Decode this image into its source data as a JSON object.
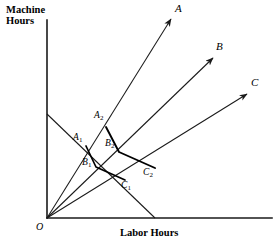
{
  "figure": {
    "kind": "economics-isoquant-process-ray-diagram",
    "background_color": "#ffffff",
    "line_color": "#1a1a1a",
    "width": 278,
    "height": 245
  },
  "axes": {
    "y_axis_title": "Machine\nHours",
    "y_axis_title_line1": "Machine",
    "y_axis_title_line2": "Hours",
    "x_axis_title": "Labor Hours",
    "origin_label": "O",
    "origin_px": [
      47,
      218
    ],
    "x_axis_end_px": [
      272,
      218
    ],
    "y_axis_end_px": [
      47,
      20
    ]
  },
  "process_rays": [
    {
      "name": "A",
      "label": "A",
      "from_px": [
        47,
        218
      ],
      "to_px": [
        171,
        19
      ],
      "arrow": true
    },
    {
      "name": "B",
      "label": "B",
      "from_px": [
        47,
        218
      ],
      "to_px": [
        213,
        58
      ],
      "arrow": true
    },
    {
      "name": "C",
      "label": "C",
      "from_px": [
        47,
        218
      ],
      "to_px": [
        247,
        94
      ],
      "arrow": true
    }
  ],
  "ray_labels": [
    {
      "text": "A",
      "x": 175,
      "y": 3
    },
    {
      "text": "B",
      "x": 216,
      "y": 41
    },
    {
      "text": "C",
      "x": 251,
      "y": 77
    }
  ],
  "isoquants": [
    {
      "name": "inner-isoquant",
      "level": 1,
      "vertices": [
        {
          "label": "A",
          "sub": "1",
          "x": 86,
          "y": 146
        },
        {
          "label": "B",
          "sub": "1",
          "x": 96,
          "y": 167
        },
        {
          "label": "C",
          "sub": "1",
          "x": 125,
          "y": 180
        }
      ]
    },
    {
      "name": "outer-isoquant",
      "level": 2,
      "vertices": [
        {
          "label": "A",
          "sub": "2",
          "x": 106,
          "y": 127
        },
        {
          "label": "B",
          "sub": "2",
          "x": 119,
          "y": 152
        },
        {
          "label": "C",
          "sub": "2",
          "x": 155,
          "y": 168
        }
      ]
    }
  ],
  "point_labels": [
    {
      "text": "A",
      "sub": "1",
      "x": 73,
      "y": 132
    },
    {
      "text": "A",
      "sub": "2",
      "x": 94,
      "y": 110
    },
    {
      "text": "B",
      "sub": "1",
      "x": 82,
      "y": 157
    },
    {
      "text": "B",
      "sub": "2",
      "x": 105,
      "y": 138
    },
    {
      "text": "C",
      "sub": "1",
      "x": 121,
      "y": 180
    },
    {
      "text": "C",
      "sub": "2",
      "x": 143,
      "y": 167
    }
  ],
  "isocost_line": {
    "name": "isocost-line",
    "from_px": [
      47,
      114
    ],
    "to_px": [
      155,
      218
    ]
  }
}
